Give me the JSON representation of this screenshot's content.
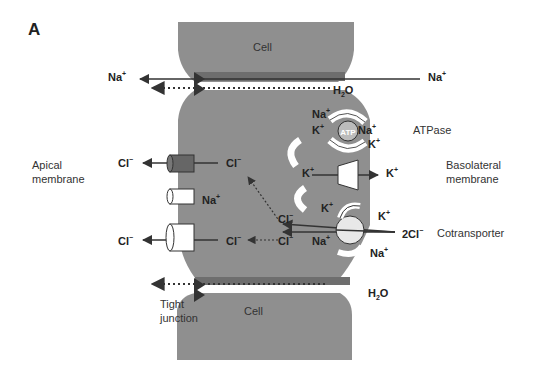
{
  "figure": {
    "panel_label": "A"
  },
  "cells": {
    "top_cell_label": "Cell",
    "bottom_cell_label": "Cell"
  },
  "labels": {
    "apical_membrane": [
      "Apical",
      "membrane"
    ],
    "basolateral_membrane": [
      "Basolateral",
      "membrane"
    ],
    "tight_junction": [
      "Tight",
      "junction"
    ],
    "atpase": "ATPase",
    "cotransporter": "Cotransporter",
    "atp": "ATP"
  },
  "ions": {
    "na_top_left": "Na",
    "na_top_right": "Na",
    "h2o_top": "H",
    "h2o_bottom": "H",
    "cl_apical_out_1": "Cl",
    "cl_apical_in_1": "Cl",
    "na_channel": "Na",
    "cl_apical_out_2": "Cl",
    "cl_apical_in_2": "Cl",
    "cl_from_cotransporter_1": "Cl",
    "cl_from_cotransporter_2": "Cl",
    "atpase_na_in": "Na",
    "atpase_k_in": "K",
    "atpase_na_out": "Na",
    "atpase_k_out": "K",
    "k_channel_in": "K",
    "k_channel_out": "K",
    "k_recycle": "K",
    "cotrans_k_out": "K",
    "cotrans_na_in": "Na",
    "cotrans_na_out": "Na",
    "cotrans_2cl": "2Cl"
  },
  "colors": {
    "cell_fill": "#8f8f8f",
    "cell_dark_band": "#6e6e6e",
    "arrow": "#333333",
    "channel_dark": "#666666",
    "white": "#ffffff",
    "text": "#222222"
  }
}
